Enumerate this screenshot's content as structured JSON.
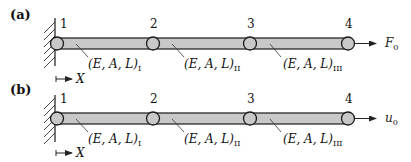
{
  "figure": {
    "panels": [
      {
        "id": "a",
        "label": "(a)",
        "nodes": [
          "1",
          "2",
          "3",
          "4"
        ],
        "elements": [
          {
            "text": "(E, A, L)",
            "sub": "I"
          },
          {
            "text": "(E, A, L)",
            "sub": "II"
          },
          {
            "text": "(E, A, L)",
            "sub": "III"
          }
        ],
        "axis_label": "X",
        "load_label": "F",
        "load_sub": "0",
        "load_type": "force"
      },
      {
        "id": "b",
        "label": "(b)",
        "nodes": [
          "1",
          "2",
          "3",
          "4"
        ],
        "elements": [
          {
            "text": "(E, A, L)",
            "sub": "I"
          },
          {
            "text": "(E, A, L)",
            "sub": "II"
          },
          {
            "text": "(E, A, L)",
            "sub": "III"
          }
        ],
        "axis_label": "X",
        "load_label": "u",
        "load_sub": "0",
        "load_type": "displacement"
      }
    ],
    "colors": {
      "bar_fill": "#c8c8c8",
      "stroke": "#1a1a1a",
      "node_fill": "#c8c8c8"
    }
  }
}
